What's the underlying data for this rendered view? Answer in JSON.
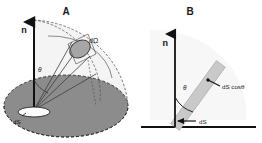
{
  "figure": {
    "width": 262,
    "height": 143,
    "background": "#ffffff",
    "ink_color": "#1a1a1a"
  },
  "panels": {
    "a": {
      "label": "A",
      "label_x": 66,
      "label_y": 15,
      "normal_label": "n",
      "normal_label_x": 24,
      "normal_label_y": 33,
      "theta_label": "θ",
      "theta_label_x": 38,
      "theta_label_y": 72,
      "solid_angle_label": "dΩ",
      "solid_angle_label_x": 89,
      "solid_angle_label_y": 43,
      "area_label": "dS",
      "area_label_x": 13,
      "area_label_y": 124
    },
    "b": {
      "label": "B",
      "label_x": 190,
      "label_y": 15,
      "normal_label": "n",
      "normal_label_x": 168,
      "normal_label_y": 46,
      "theta_label": "θ",
      "theta_label_x": 183,
      "theta_label_y": 90,
      "projected_label": "dS cosθ",
      "projected_label_x": 222,
      "projected_label_y": 89,
      "area_label": "dS",
      "area_label_x": 199,
      "area_label_y": 124
    }
  },
  "colors": {
    "base_plane_fill": "#8c8c8c",
    "base_plane_stroke": "#2b2b2b",
    "dome_fill": "#f2f2f2",
    "patch_fill": "#a6a6a6",
    "patch_stroke": "#3a3a3a",
    "ds_ellipse_fill": "#fbfbfb",
    "ds_ellipse_stroke": "#222222",
    "bar_fill": "#c9c9c9",
    "bar_stroke": "#a8a8a8",
    "axis_stroke": "#111111",
    "ray_stroke": "#3d3d3d",
    "arc_stroke": "#5a5a5a"
  },
  "geometry": {
    "panel_a": {
      "origin_x": 34,
      "origin_y": 110,
      "normal_tip_x": 34,
      "normal_tip_y": 20,
      "patch_cx": 80,
      "patch_cy": 49,
      "patch_rx": 11,
      "patch_ry": 8,
      "patch_rotation": -32,
      "base_ellipse_cx": 66,
      "base_ellipse_cy": 106,
      "base_ellipse_rx": 62,
      "base_ellipse_ry": 31,
      "ds_ellipse_cx": 34,
      "ds_ellipse_cy": 112,
      "ds_ellipse_rx": 16,
      "ds_ellipse_ry": 5
    },
    "panel_b": {
      "origin_x": 175,
      "origin_y": 127,
      "normal_tip_x": 175,
      "normal_tip_y": 32,
      "baseline_x1": 141,
      "baseline_x2": 256,
      "baseline_y": 127,
      "bar_angle_deg": 36,
      "bar_length": 78,
      "bar_width": 11
    }
  }
}
